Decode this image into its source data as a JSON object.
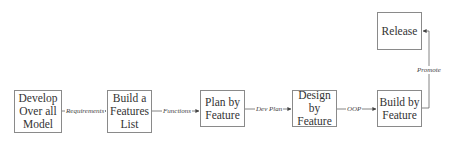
{
  "diagram": {
    "type": "flowchart",
    "nodes": [
      {
        "id": "develop",
        "label": "Develop\nOver all\nModel"
      },
      {
        "id": "features_list",
        "label": "Build a\nFeatures\nList"
      },
      {
        "id": "plan",
        "label": "Plan by\nFeature"
      },
      {
        "id": "design",
        "label": "Design by\nFeature"
      },
      {
        "id": "build",
        "label": "Build by\nFeature"
      },
      {
        "id": "release",
        "label": "Release"
      }
    ],
    "edges": [
      {
        "from": "develop",
        "to": "features_list",
        "label": "Requirements"
      },
      {
        "from": "features_list",
        "to": "plan",
        "label": "Functions"
      },
      {
        "from": "plan",
        "to": "design",
        "label": "Dev Plan"
      },
      {
        "from": "design",
        "to": "build",
        "label": "OOP"
      },
      {
        "from": "build",
        "to": "release",
        "label": "Promote"
      }
    ],
    "colors": {
      "border": "#8a8a8a",
      "text": "#333333",
      "arrow": "#555555"
    }
  }
}
